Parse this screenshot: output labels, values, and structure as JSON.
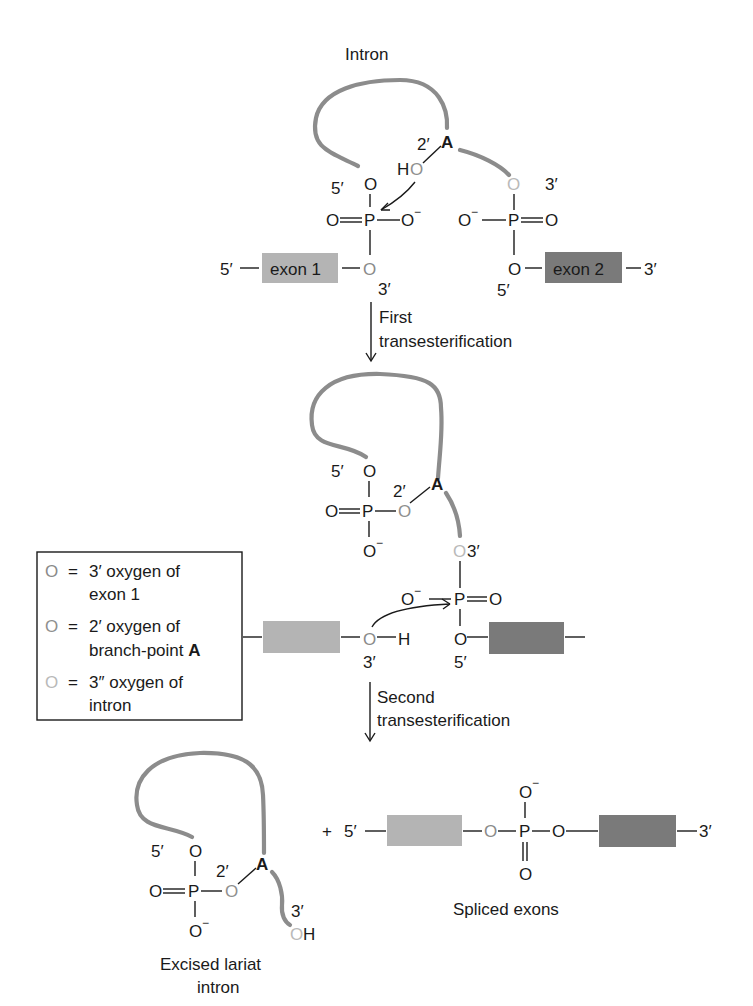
{
  "colors": {
    "intron_strand": "#8c8c8c",
    "exon1": "#b4b4b4",
    "exon2": "#7a7a7a",
    "oxygen_exon1_3prime": "#8a8a8a",
    "oxygen_branch_2prime": "#8f8f8f",
    "oxygen_intron_3prime": "#b9b9b9",
    "text": "#1a1a1a"
  },
  "stage1": {
    "intron_label": "Intron",
    "branch_A": "A",
    "prime2": "2′",
    "HO_H": "H",
    "HO_O": "O",
    "prime5_left": "5′",
    "O_top_left": "O",
    "O_double_left": "O",
    "P_left": "P",
    "O_minus_left": "O",
    "minus": "−",
    "O_bottom_left": "O",
    "prime3_left": "3′",
    "O_top_right": "O",
    "prime3_right": "3′",
    "O_minus_right": "O",
    "P_right": "P",
    "O_double_right": "O",
    "O_bottom_right": "O",
    "prime5_right": "5′",
    "exon1_label": "exon 1",
    "exon2_label": "exon 2",
    "end5": "5′",
    "end3": "3′"
  },
  "step1": {
    "line1": "First",
    "line2": "transesterification"
  },
  "stage2": {
    "prime5": "5′",
    "O_top": "O",
    "prime2": "2′",
    "branch_A": "A",
    "O_double": "O",
    "P": "P",
    "O_branch": "O",
    "O_minus": "O",
    "minus": "−",
    "O_intron3": "O",
    "prime3_top": "3′",
    "O_minus_right": "O",
    "P_right": "P",
    "O_double_right": "O",
    "O_exon1": "O",
    "H": "H",
    "prime3_bottom": "3′",
    "O_exon2": "O",
    "prime5_bottom": "5′"
  },
  "legend": {
    "items": [
      {
        "symbol": "O",
        "eq": "=",
        "line1": "3′ oxygen of",
        "line2": "exon 1",
        "bold": ""
      },
      {
        "symbol": "O",
        "eq": "=",
        "line1": "2′ oxygen of",
        "line2": "branch-point ",
        "bold": "A"
      },
      {
        "symbol": "O",
        "eq": "=",
        "line1": "3″ oxygen of",
        "line2": "intron",
        "bold": ""
      }
    ]
  },
  "step2": {
    "line1": "Second",
    "line2": "transesterification"
  },
  "stage3": {
    "lariat": {
      "prime5": "5′",
      "O_top": "O",
      "prime2": "2′",
      "branch_A": "A",
      "O_double": "O",
      "P": "P",
      "O_branch": "O",
      "O_minus": "O",
      "minus": "−",
      "prime3": "3′",
      "OH_O": "O",
      "OH_H": "H",
      "caption_line1": "Excised lariat",
      "caption_line2": "intron"
    },
    "plus": "+",
    "spliced": {
      "end5": "5′",
      "O_left": "O",
      "P": "P",
      "O_right": "O",
      "O_minus_top": "O",
      "minus": "−",
      "O_double_bottom": "O",
      "end3": "3′",
      "caption": "Spliced exons"
    }
  }
}
